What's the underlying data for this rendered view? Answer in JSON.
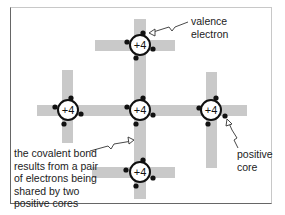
{
  "diagram": {
    "title": "",
    "atom_charge_label": "+4",
    "colors": {
      "bond_band": "#c9c9c9",
      "electron": "#111111",
      "core_outline": "#111111",
      "core_fill": "#ffffff",
      "frame": "#666666",
      "text": "#222222"
    },
    "atoms": [
      {
        "id": "top",
        "label": "+4",
        "cx": 140,
        "cy": 45
      },
      {
        "id": "left",
        "label": "+4",
        "cx": 68,
        "cy": 110
      },
      {
        "id": "center",
        "label": "+4",
        "cx": 140,
        "cy": 110
      },
      {
        "id": "right",
        "label": "+4",
        "cx": 211,
        "cy": 110
      },
      {
        "id": "bottom",
        "label": "+4",
        "cx": 140,
        "cy": 172
      }
    ],
    "annotations": {
      "valence_electron": {
        "line1": "valence",
        "line2": "electron"
      },
      "positive_core": {
        "line1": "positive",
        "line2": "core"
      },
      "covalent_bond": {
        "line1": "the covalent bond",
        "line2": "results from a pair",
        "line3": "of electrons being",
        "line4": "shared by two",
        "line5": "positive cores"
      }
    }
  }
}
